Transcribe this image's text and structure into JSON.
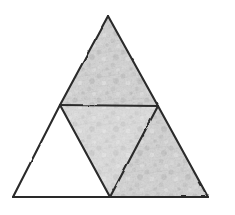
{
  "figure": {
    "background_color": "#ffffff",
    "canvas": {
      "width": 235,
      "height": 215
    },
    "style": {
      "line_color": "#2b2b2b",
      "line_width_px": 2.1,
      "stroke_appearance": "hand-drawn wobbly pencil",
      "shade_color": "#c9c9c9",
      "shade_appearance": "mottled pencil texture",
      "unshaded_color": "#ffffff"
    },
    "outer_triangle": {
      "name": "large-triangle",
      "vertices": {
        "apex": {
          "x": 108,
          "y": 16
        },
        "bottom_left": {
          "x": 13,
          "y": 197
        },
        "bottom_right": {
          "x": 208,
          "y": 197
        }
      }
    },
    "midpoints": {
      "left_side": {
        "x": 60,
        "y": 105
      },
      "right_side": {
        "x": 158,
        "y": 106
      },
      "base": {
        "x": 110,
        "y": 197
      }
    },
    "regions": [
      {
        "id": "top",
        "label": "Top triangle",
        "shaded": true,
        "orientation": "upright",
        "points": "108,16 60,105 158,106"
      },
      {
        "id": "middle",
        "label": "Middle inverted triangle",
        "shaded": true,
        "orientation": "inverted",
        "points": "60,105 158,106 110,197"
      },
      {
        "id": "bottom-left",
        "label": "Bottom-left triangle",
        "shaded": false,
        "orientation": "upright",
        "points": "13,197 60,105 110,197"
      },
      {
        "id": "bottom-right",
        "label": "Bottom-right triangle",
        "shaded": true,
        "orientation": "upright",
        "points": "110,197 158,106 208,197"
      }
    ],
    "edges": [
      {
        "id": "left-side",
        "label": "Left outer side",
        "path": "M108,16 L60,105 L13,197"
      },
      {
        "id": "right-side",
        "label": "Right outer side",
        "path": "M108,16 L158,106 L208,197"
      },
      {
        "id": "base",
        "label": "Base",
        "path": "M13,197 L110,197 L208,197"
      },
      {
        "id": "midline",
        "label": "Horizontal midline",
        "path": "M60,105 L158,106"
      },
      {
        "id": "left-median",
        "label": "Left inner segment",
        "path": "M60,105 L110,197"
      },
      {
        "id": "right-median",
        "label": "Right inner segment",
        "path": "M158,106 L110,197"
      }
    ],
    "counts": {
      "total_regions": 4,
      "shaded_regions": 3,
      "unshaded_regions": 1,
      "shaded_fraction": "3/4"
    }
  }
}
